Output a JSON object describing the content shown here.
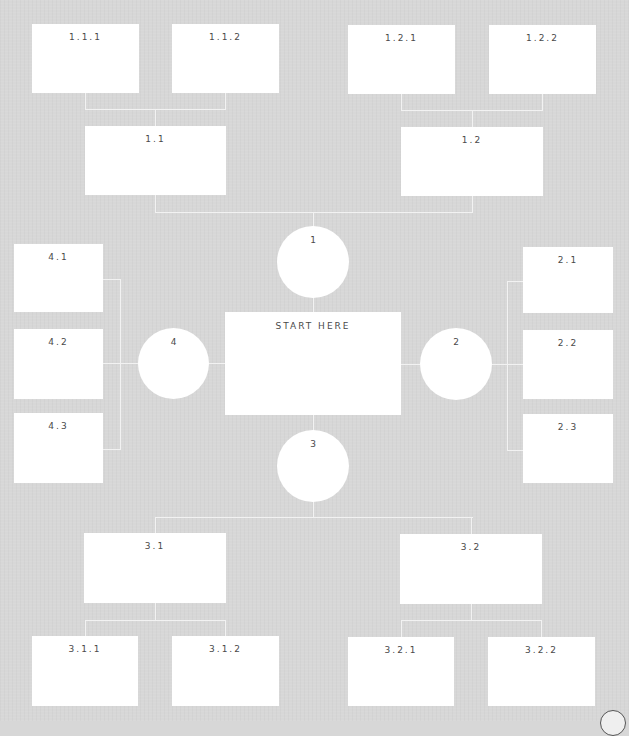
{
  "diagram": {
    "center": {
      "label": "START HERE"
    },
    "branches": [
      {
        "id": "1",
        "label": "1",
        "children": [
          {
            "label": "1.1",
            "children": [
              {
                "label": "1.1.1"
              },
              {
                "label": "1.1.2"
              }
            ]
          },
          {
            "label": "1.2",
            "children": [
              {
                "label": "1.2.1"
              },
              {
                "label": "1.2.2"
              }
            ]
          }
        ]
      },
      {
        "id": "2",
        "label": "2",
        "children": [
          {
            "label": "2.1"
          },
          {
            "label": "2.2"
          },
          {
            "label": "2.3"
          }
        ]
      },
      {
        "id": "3",
        "label": "3",
        "children": [
          {
            "label": "3.1",
            "children": [
              {
                "label": "3.1.1"
              },
              {
                "label": "3.1.2"
              }
            ]
          },
          {
            "label": "3.2",
            "children": [
              {
                "label": "3.2.1"
              },
              {
                "label": "3.2.2"
              }
            ]
          }
        ]
      },
      {
        "id": "4",
        "label": "4",
        "children": [
          {
            "label": "4.1"
          },
          {
            "label": "4.2"
          },
          {
            "label": "4.3"
          }
        ]
      }
    ]
  },
  "colors": {
    "background": "#d7d7d7",
    "node": "#ffffff",
    "connector": "#f2f2f2",
    "text": "#4a4a4a"
  }
}
